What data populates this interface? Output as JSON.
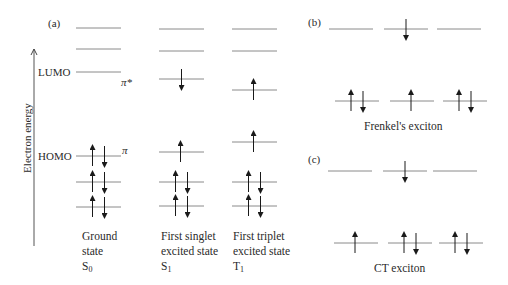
{
  "figure": {
    "axis": {
      "label": "Electron energy",
      "direction": "up"
    },
    "panel_a": {
      "label": "(a)",
      "level_labels": {
        "lumo": "LUMO",
        "homo": "HOMO",
        "pi_star": "π*",
        "pi": "π"
      },
      "columns": [
        {
          "caption_line1": "Ground",
          "caption_line2": "state",
          "symbol": "S",
          "symbol_sub": "0",
          "levels": [
            {
              "y": 28,
              "spins": ""
            },
            {
              "y": 49,
              "spins": ""
            },
            {
              "y": 72,
              "spins": "",
              "name": "LUMO"
            },
            {
              "y": 156,
              "spins": "up-down",
              "name": "HOMO"
            },
            {
              "y": 182,
              "spins": "up-down"
            },
            {
              "y": 207,
              "spins": "up-down"
            }
          ]
        },
        {
          "caption_line1": "First singlet",
          "caption_line2": "excited state",
          "symbol": "S",
          "symbol_sub": "1",
          "levels": [
            {
              "y": 29,
              "spins": ""
            },
            {
              "y": 51,
              "spins": ""
            },
            {
              "y": 79,
              "spins": "down"
            },
            {
              "y": 152,
              "spins": "up"
            },
            {
              "y": 182,
              "spins": "up-down"
            },
            {
              "y": 206,
              "spins": "up-down"
            }
          ]
        },
        {
          "caption_line1": "First triplet",
          "caption_line2": "excited state",
          "symbol": "T",
          "symbol_sub": "1",
          "levels": [
            {
              "y": 29,
              "spins": ""
            },
            {
              "y": 51,
              "spins": ""
            },
            {
              "y": 90,
              "spins": "up"
            },
            {
              "y": 142,
              "spins": "up"
            },
            {
              "y": 182,
              "spins": "up-down"
            },
            {
              "y": 206,
              "spins": "up-down"
            }
          ]
        }
      ]
    },
    "panel_b": {
      "label": "(b)",
      "caption": "Frenkel's exciton",
      "top_levels": [
        "",
        "down",
        ""
      ],
      "bottom_levels": [
        "up-down",
        "up",
        "up-down"
      ]
    },
    "panel_c": {
      "label": "(c)",
      "caption": "CT exciton",
      "top_levels": [
        "",
        "down",
        ""
      ],
      "bottom_levels": [
        "up",
        "up-down",
        "up-down"
      ]
    },
    "colors": {
      "line": "#8a8a8a",
      "arrow": "#1a1a1a",
      "text": "#2a2a2a"
    }
  }
}
